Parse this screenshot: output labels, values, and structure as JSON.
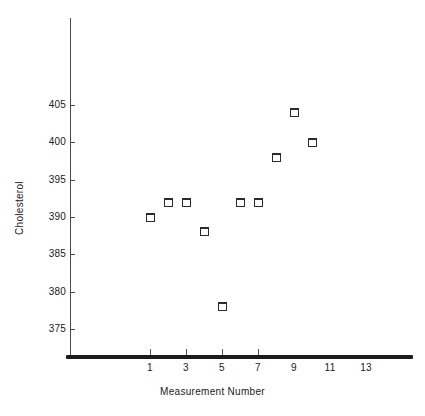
{
  "chart_data": {
    "type": "scatter",
    "title": "",
    "xlabel": "Measurement Number",
    "ylabel": "Cholesterol",
    "x": [
      1,
      2,
      3,
      4,
      5,
      6,
      7,
      8,
      9,
      10
    ],
    "values": [
      390,
      392,
      392,
      388,
      378,
      392,
      392,
      398,
      404,
      400
    ],
    "series": [
      {
        "name": "Cholesterol",
        "points": [
          {
            "x": 1,
            "y": 390
          },
          {
            "x": 2,
            "y": 392
          },
          {
            "x": 3,
            "y": 392
          },
          {
            "x": 4,
            "y": 388
          },
          {
            "x": 5,
            "y": 378
          },
          {
            "x": 6,
            "y": 392
          },
          {
            "x": 7,
            "y": 392
          },
          {
            "x": 8,
            "y": 398
          },
          {
            "x": 9,
            "y": 404
          },
          {
            "x": 10,
            "y": 400
          }
        ]
      }
    ],
    "xlim": [
      0,
      15
    ],
    "ylim": [
      372,
      410
    ],
    "xticks": [
      1,
      3,
      5,
      7,
      9,
      11,
      13
    ],
    "xtick_labels": [
      "1",
      "3",
      "5",
      "7",
      "9",
      "11",
      "13"
    ],
    "yticks": [
      375,
      380,
      385,
      390,
      395,
      400,
      405
    ],
    "ytick_labels": [
      "375",
      "380",
      "385",
      "390",
      "395",
      "400",
      "405"
    ],
    "grid": false,
    "legend": null,
    "marker": "open-square",
    "marker_color": "#2b2b2b",
    "axis_color": "#4a4a4a",
    "xaxis_color": "#1c1c1c",
    "background": "#ffffff"
  }
}
